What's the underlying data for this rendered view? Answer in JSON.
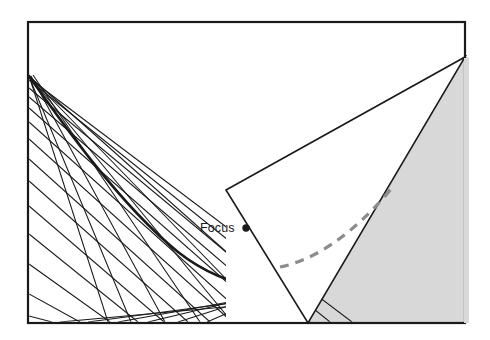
{
  "figure": {
    "type": "geometric-diagram",
    "canvas": {
      "width": 490,
      "height": 340
    },
    "frame": {
      "x": 28,
      "y": 22,
      "width": 437,
      "height": 301,
      "stroke": "#1a1a1a",
      "stroke_width": 2.2,
      "fill": "#ffffff"
    },
    "colors": {
      "ink": "#1a1a1a",
      "shaded_region": "#d8d8d8",
      "dashed_curve": "#8c8c8c",
      "background": "#ffffff"
    },
    "labels": [
      {
        "name": "focus-label",
        "text": "Focus",
        "x": 200,
        "y": 221,
        "font_size": 12.5
      }
    ],
    "focus_point": {
      "name": "focus-point",
      "x": 246,
      "y": 228,
      "radius": 3.6,
      "fill": "#1a1a1a"
    },
    "parabola": {
      "description": "Envelope of tangent lines, vertex near bottom-center-left",
      "vertex": {
        "x": 228,
        "y": 276
      },
      "opens": "up-left",
      "tangent_count": 24,
      "tangent_stroke": "#1a1a1a",
      "tangent_stroke_width": 1.0
    },
    "tangent_lines_left_edge": {
      "x": 29,
      "y_start": 80,
      "y_end": 322,
      "count": 13
    },
    "tangent_lines_bottom_edge": {
      "y": 322,
      "x_start": 60,
      "x_end": 307,
      "count": 13
    },
    "shaded_wedge": {
      "name": "shaded-region",
      "points": "465,57 308,323 468,323 468,57",
      "fill": "#d8d8d8",
      "note": "gray region right of reflected ray"
    },
    "beam_wedge": {
      "name": "beam-wedge",
      "description": "White wedge bounded by ray from focus and ray to frame corner",
      "vertex": {
        "x": 226,
        "y": 190
      },
      "corner": {
        "x": 465,
        "y": 57
      },
      "foot": {
        "x": 308,
        "y": 323
      }
    },
    "dashed_curve": {
      "name": "dashed-directrix-curve",
      "path": "M 280,267 C 310,262 350,237 390,190",
      "stroke": "#8c8c8c",
      "stroke_width": 3.1,
      "dash": "9 7"
    }
  }
}
